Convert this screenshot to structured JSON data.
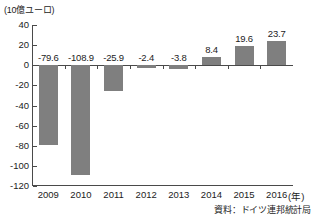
{
  "chart_data": {
    "type": "bar",
    "title": "",
    "subtitle": "",
    "unit_label": "(10億ユーロ)",
    "xlabel": "(年)",
    "ylabel": "",
    "categories": [
      "2009",
      "2010",
      "2011",
      "2012",
      "2013",
      "2014",
      "2015",
      "2016"
    ],
    "values": [
      -79.6,
      -108.9,
      -25.9,
      -2.4,
      -3.8,
      8.4,
      19.6,
      23.7
    ],
    "data_labels": [
      "-79.6",
      "-108.9",
      "-25.9",
      "-2.4",
      "-3.8",
      "8.4",
      "19.6",
      "23.7"
    ],
    "ylim": [
      -120,
      40
    ],
    "yticks": [
      40,
      20,
      0,
      -20,
      -40,
      -60,
      -80,
      -100,
      -120
    ],
    "ytick_labels": [
      "40",
      "20",
      "0",
      "-20",
      "-40",
      "-60",
      "-80",
      "-100",
      "-120"
    ],
    "grid": false,
    "legend": null,
    "bar_color": "#7f7f7f",
    "axis_color": "#4a4a4a",
    "source_note": "資料：ドイツ連邦統計局"
  }
}
